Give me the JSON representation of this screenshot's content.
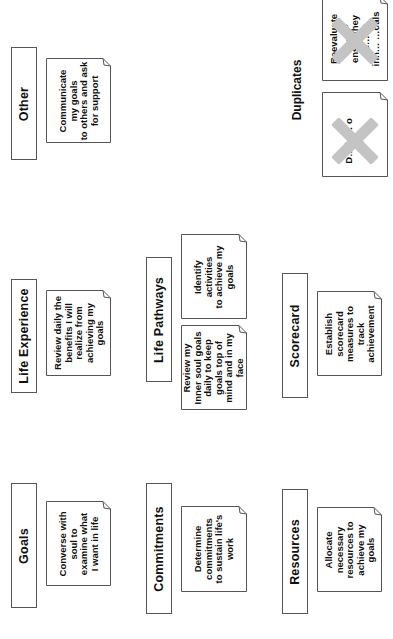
{
  "diagram": {
    "orientation": "rotated -90deg (text reads bottom-to-top)",
    "categories": [
      {
        "label": "Goals",
        "notes": [
          {
            "lines": [
              "Converse with",
              "soul to",
              "examine what",
              "I want in life"
            ]
          }
        ]
      },
      {
        "label": "Commitments",
        "notes": [
          {
            "lines": [
              "Determine",
              "commitments",
              "to sustain life's",
              "work"
            ]
          }
        ]
      },
      {
        "label": "Resources",
        "notes": [
          {
            "lines": [
              "Allocate",
              "necessary",
              "resources to",
              "achieve my",
              "goals"
            ]
          }
        ]
      },
      {
        "label": "Life Experience",
        "notes": [
          {
            "lines": [
              "Review daily the",
              "benefits I will",
              "realize from",
              "achieving my",
              "goals"
            ]
          }
        ]
      },
      {
        "label": "Life Pathways",
        "notes": [
          {
            "lines": [
              "Review my",
              "Inner soul goals",
              "daily to keep",
              "goals top of",
              "mind and in my",
              "face"
            ]
          },
          {
            "lines": [
              "Identify",
              "activities",
              "to achieve my",
              "goals"
            ]
          }
        ]
      },
      {
        "label": "Scorecard",
        "notes": [
          {
            "lines": [
              "Establish",
              "scorecard",
              "measures to",
              "track",
              "achievement"
            ]
          }
        ]
      },
      {
        "label": "Other",
        "notes": [
          {
            "lines": [
              "Communicate",
              "my goals",
              "to others and ask",
              "for support"
            ]
          }
        ]
      }
    ],
    "duplicates": {
      "label": "Duplicates",
      "notes": [
        {
          "lines": [
            "Reevaluate",
            "m… to",
            "ens… they",
            "re… nt",
            "inn… …oals"
          ],
          "crossed_out": true
        },
        {
          "lines": [
            "D… id… o",
            "p… e"
          ],
          "crossed_out": true
        }
      ]
    },
    "colors": {
      "border": "#555555",
      "text": "#111111",
      "cross": "#c4c4c4",
      "background": "#ffffff"
    }
  }
}
